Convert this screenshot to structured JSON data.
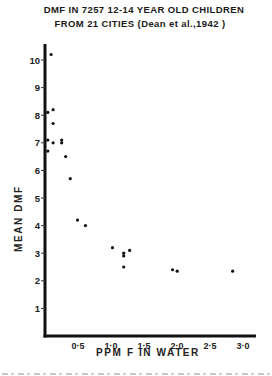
{
  "title_line1": "DMF IN 7257 12-14 YEAR OLD CHILDREN",
  "title_line2": "FROM 21 CITIES (Dean et al.,1942 )",
  "chart_data": {
    "type": "scatter",
    "xlabel": "PPM F IN WATER",
    "ylabel": "MEAN DMF",
    "xlim": [
      0,
      3.0
    ],
    "ylim": [
      0,
      10.3
    ],
    "x_ticks": [
      0.5,
      1.0,
      1.5,
      2.0,
      2.5,
      3.0
    ],
    "x_tick_labels": [
      "0·5",
      "1·0",
      "1·5",
      "2·0",
      "2·5",
      "3·0"
    ],
    "y_ticks": [
      1,
      2,
      3,
      4,
      5,
      6,
      7,
      8,
      9,
      10
    ],
    "y_tick_labels": [
      "1",
      "2",
      "3",
      "4",
      "5",
      "6",
      "7",
      "8",
      "9",
      "10"
    ],
    "grid": false,
    "legend": null,
    "series": [
      {
        "name": "cities",
        "points": [
          [
            0.07,
            10.2
          ],
          [
            0.02,
            8.1
          ],
          [
            0.1,
            8.2
          ],
          [
            0.1,
            7.7
          ],
          [
            0.02,
            7.1
          ],
          [
            0.1,
            7.0
          ],
          [
            0.23,
            7.1
          ],
          [
            0.23,
            7.0
          ],
          [
            0.02,
            6.7
          ],
          [
            0.29,
            6.5
          ],
          [
            0.36,
            5.7
          ],
          [
            0.47,
            4.2
          ],
          [
            0.59,
            4.0
          ],
          [
            1.0,
            3.2
          ],
          [
            1.17,
            3.0
          ],
          [
            1.17,
            2.9
          ],
          [
            1.26,
            3.1
          ],
          [
            1.17,
            2.5
          ],
          [
            1.91,
            2.4
          ],
          [
            1.98,
            2.35
          ],
          [
            2.82,
            2.35
          ]
        ]
      }
    ]
  }
}
